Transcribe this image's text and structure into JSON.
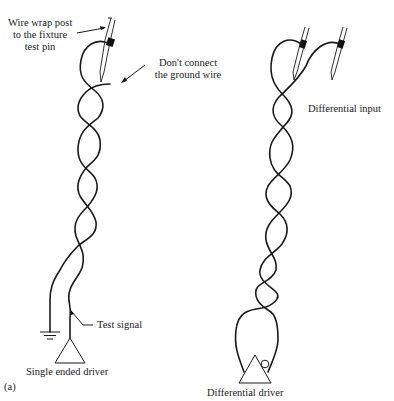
{
  "figure": {
    "panel_a": {
      "tag": "(a)",
      "labels": {
        "wire_wrap_line1": "Wire wrap post",
        "wire_wrap_line2": "to the fixture",
        "wire_wrap_line3": "test pin",
        "ground_note_line1": "Don't connect",
        "ground_note_line2": "the ground wire",
        "test_signal": "Test signal",
        "driver": "Single ended driver"
      }
    },
    "panel_b": {
      "tag": "(b)",
      "labels": {
        "input": "Differential input",
        "driver": "Differential driver"
      }
    },
    "colors": {
      "line": "#1a1a1a",
      "background": "#ffffff"
    }
  }
}
